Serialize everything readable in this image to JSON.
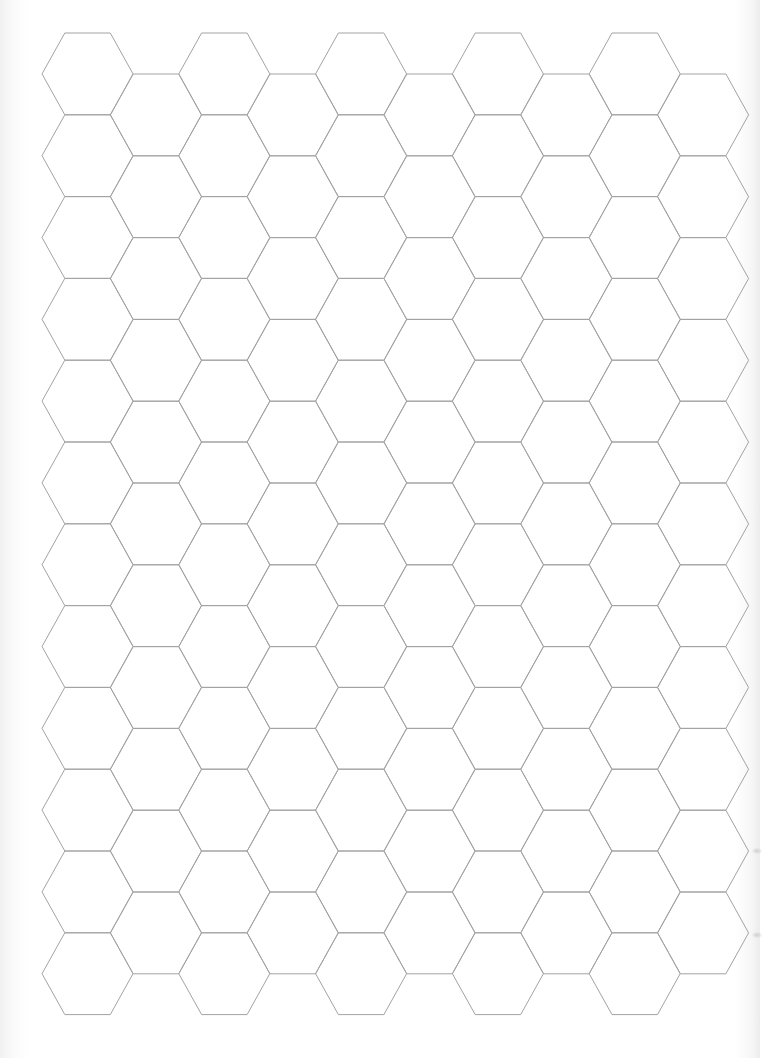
{
  "page": {
    "type": "hexagonal grid paper",
    "width": 760,
    "height": 1058,
    "background_color": "#ffffff",
    "line_color": "#a3a3a3"
  },
  "grid": {
    "orientation": "flat-top",
    "columns": 10,
    "first_vertex_x": 42,
    "column_step_x": 68.4,
    "hex_width": 91,
    "hex_height": 81.8,
    "odd_columns": {
      "top_y": 33,
      "hex_count": 12
    },
    "even_columns": {
      "top_y": 74,
      "hex_count": 11
    }
  },
  "scan_marks": [
    {
      "x": 752,
      "y": 848
    },
    {
      "x": 752,
      "y": 932
    }
  ]
}
